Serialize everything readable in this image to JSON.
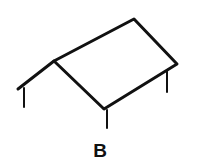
{
  "figure": {
    "label": "B",
    "stroke_color": "#111111",
    "background": "#ffffff"
  }
}
